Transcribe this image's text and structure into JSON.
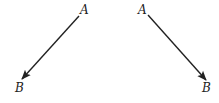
{
  "diagram": {
    "arrows": [
      {
        "name": "left-vector",
        "start_label": "A",
        "end_label": "B",
        "x1": 79,
        "y1": 16,
        "x2": 22,
        "y2": 79,
        "start_label_pos": [
          80,
          14
        ],
        "end_label_pos": [
          15,
          92
        ]
      },
      {
        "name": "right-vector",
        "start_label": "A",
        "end_label": "B",
        "x1": 148,
        "y1": 15,
        "x2": 206,
        "y2": 80,
        "start_label_pos": [
          138,
          14
        ],
        "end_label_pos": [
          202,
          92
        ]
      }
    ],
    "colors": {
      "stroke": "#222222",
      "background": "#ffffff"
    }
  }
}
